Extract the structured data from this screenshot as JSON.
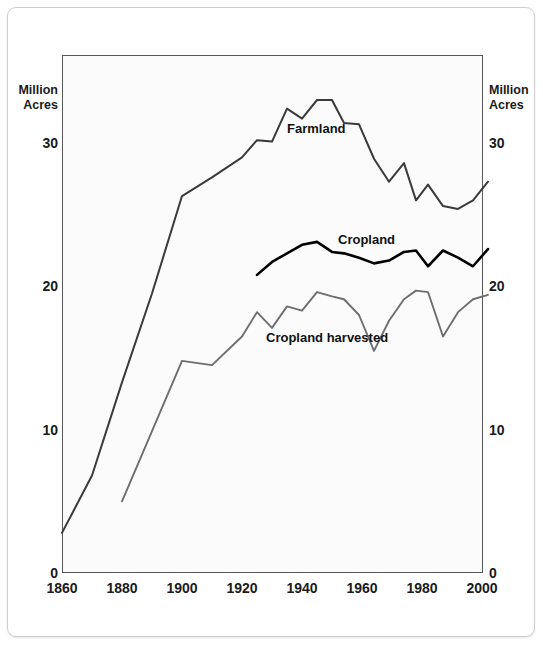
{
  "axes": {
    "left_caption": "Million\nAcres",
    "right_caption": "Million\nAcres",
    "y_ticks": [
      "0",
      "10",
      "20",
      "30"
    ],
    "x_ticks": [
      "1860",
      "1880",
      "1900",
      "1920",
      "1940",
      "1960",
      "1980",
      "2000"
    ]
  },
  "series_labels": {
    "farmland": "Farmland",
    "cropland": "Cropland",
    "cropland_harvested": "Cropland harvested"
  },
  "colors": {
    "farmland": "#3a3a3c",
    "cropland": "#000000",
    "cropland_harvested": "#6e6e70",
    "frame": "#58585a",
    "plot_background": "#fbfbfb",
    "text": "#1a1a1a"
  },
  "chart_data": {
    "type": "line",
    "title": "",
    "subtitle": "",
    "xlabel": "",
    "ylabel": "Million Acres",
    "xlim": [
      1860,
      2002
    ],
    "ylim": [
      0,
      36.1
    ],
    "grid": false,
    "legend": "inline-labels",
    "y_tick_values": [
      0,
      10,
      20,
      30
    ],
    "x_tick_values": [
      1860,
      1880,
      1900,
      1920,
      1940,
      1960,
      1980,
      2000
    ],
    "units": "million acres",
    "series": [
      {
        "name": "Farmland",
        "color": "#3a3a3c",
        "x": [
          1860,
          1870,
          1880,
          1890,
          1900,
          1910,
          1920,
          1925,
          1930,
          1935,
          1940,
          1945,
          1950,
          1954,
          1959,
          1964,
          1969,
          1974,
          1978,
          1982,
          1987,
          1992,
          1997,
          2002
        ],
        "values": [
          2.8,
          6.8,
          13.3,
          19.5,
          26.3,
          27.6,
          29.0,
          30.2,
          30.1,
          32.4,
          31.7,
          33.0,
          33.0,
          31.4,
          31.3,
          28.9,
          27.3,
          28.6,
          26.0,
          27.1,
          25.6,
          25.4,
          26.0,
          27.3
        ]
      },
      {
        "name": "Cropland",
        "color": "#000000",
        "x": [
          1925,
          1930,
          1935,
          1940,
          1945,
          1950,
          1954,
          1959,
          1964,
          1969,
          1974,
          1978,
          1982,
          1987,
          1992,
          1997,
          2002
        ],
        "values": [
          20.8,
          21.7,
          22.3,
          22.9,
          23.1,
          22.4,
          22.3,
          22.0,
          21.6,
          21.8,
          22.4,
          22.5,
          21.4,
          22.5,
          22.0,
          21.4,
          22.6
        ]
      },
      {
        "name": "Cropland harvested",
        "color": "#6e6e70",
        "x": [
          1880,
          1890,
          1900,
          1910,
          1920,
          1925,
          1930,
          1935,
          1940,
          1945,
          1950,
          1954,
          1959,
          1964,
          1969,
          1974,
          1978,
          1982,
          1987,
          1992,
          1997,
          2002
        ],
        "values": [
          5.0,
          9.9,
          14.8,
          14.5,
          16.5,
          18.2,
          17.1,
          18.6,
          18.3,
          19.6,
          19.3,
          19.1,
          18.0,
          15.5,
          17.6,
          19.1,
          19.7,
          19.6,
          16.5,
          18.2,
          19.1,
          19.4
        ]
      }
    ],
    "annotations": [
      {
        "text": "Farmland",
        "x": 1935,
        "y": 31.0
      },
      {
        "text": "Cropland",
        "x": 1952,
        "y": 23.2
      },
      {
        "text": "Cropland harvested",
        "x": 1928,
        "y": 16.4
      }
    ]
  }
}
